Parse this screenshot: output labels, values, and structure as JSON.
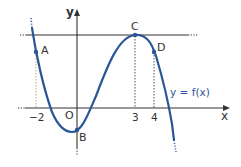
{
  "figure": {
    "type": "function-graph",
    "axes": {
      "x_label": "x",
      "y_label": "y",
      "origin_label": "O"
    },
    "x_ticks": [
      "−2",
      "3",
      "4"
    ],
    "points": [
      {
        "label": "A",
        "x": -2
      },
      {
        "label": "B",
        "x": 0
      },
      {
        "label": "C",
        "x": 3
      },
      {
        "label": "D",
        "x": 4
      }
    ],
    "curve_label": "y = f(x)",
    "horizontal_line": "tangent at C (maximum)",
    "colors": {
      "curve": "#2a5596",
      "axes": "#333333",
      "guide_lines": "#555555",
      "guide_line_A": "#c8a27a",
      "label_text": "#333333",
      "curve_label": "#2a5596"
    }
  }
}
